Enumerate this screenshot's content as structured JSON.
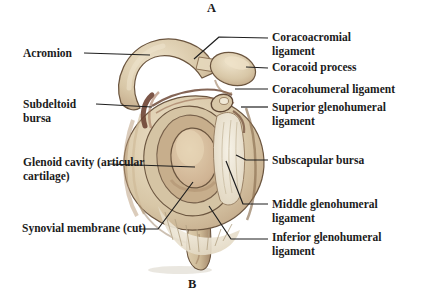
{
  "panel": {
    "top": "A",
    "bottom": "B"
  },
  "labels": {
    "acromion": "Acromion",
    "subdeltoid_bursa": "Subdeltoid bursa",
    "glenoid_cavity": "Glenoid cavity (articular cartilage)",
    "synovial_membrane": "Synovial membrane (cut)",
    "coracoacromial_ligament": "Coracoacromial ligament",
    "coracoid_process": "Coracoid process",
    "coracohumeral_ligament": "Coracohumeral ligament",
    "superior_glenohumeral_ligament": "Superior glenohumeral ligament",
    "subscapular_bursa": "Subscapular bursa",
    "middle_glenohumeral_ligament": "Middle glenohumeral ligament",
    "inferior_glenohumeral_ligament": "Inferior glenohumeral ligament"
  },
  "colors": {
    "background": "#ffffff",
    "text_color": "#1b1b1b",
    "line_color": "#1f1f1f",
    "bone_light": "#eee3cb",
    "bone_mid": "#d3c2a2",
    "bone_dark": "#a98e6d",
    "outline": "#6b553f",
    "bursa_maroon": "#6e4434",
    "membrane_white": "#f3efe3"
  }
}
